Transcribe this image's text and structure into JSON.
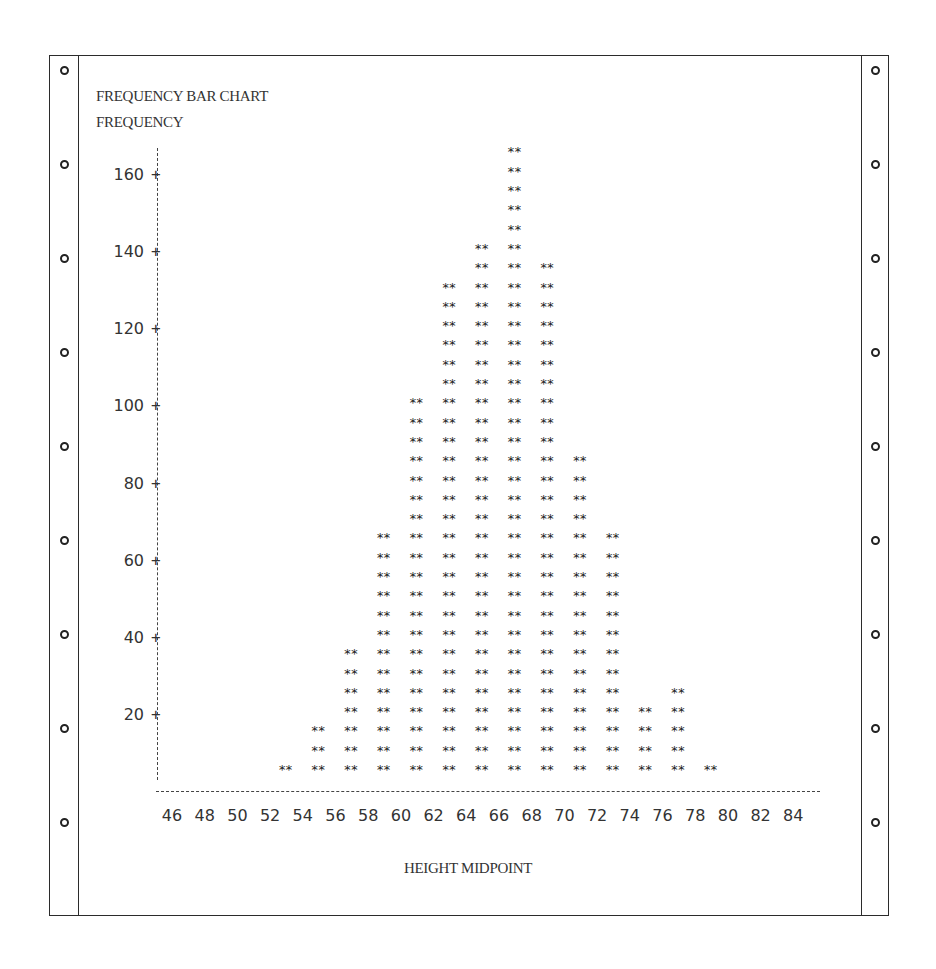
{
  "header": {
    "title": "FREQUENCY BAR CHART",
    "ylabel": "FREQUENCY"
  },
  "xaxis": {
    "label": "HEIGHT MIDPOINT",
    "ticks": [
      "46",
      "48",
      "50",
      "52",
      "54",
      "56",
      "58",
      "60",
      "62",
      "64",
      "66",
      "68",
      "70",
      "72",
      "74",
      "76",
      "78",
      "80",
      "82",
      "84"
    ]
  },
  "yaxis": {
    "ticks": [
      "160",
      "140",
      "120",
      "100",
      "80",
      "60",
      "40",
      "20"
    ]
  },
  "marker": "**",
  "chart_data": {
    "type": "bar",
    "title": "FREQUENCY BAR CHART",
    "xlabel": "HEIGHT MIDPOINT",
    "ylabel": "FREQUENCY",
    "categories": [
      53,
      55,
      57,
      59,
      61,
      63,
      65,
      67,
      69,
      71,
      73,
      75,
      77,
      79
    ],
    "values": [
      5,
      15,
      35,
      65,
      100,
      130,
      140,
      165,
      135,
      85,
      65,
      20,
      25,
      5
    ],
    "bar_unit": 5,
    "x_tick_labels": [
      46,
      48,
      50,
      52,
      54,
      56,
      58,
      60,
      62,
      64,
      66,
      68,
      70,
      72,
      74,
      76,
      78,
      80,
      82,
      84
    ],
    "y_tick_labels": [
      20,
      40,
      60,
      80,
      100,
      120,
      140,
      160
    ],
    "xlim": [
      46,
      84
    ],
    "ylim": [
      0,
      165
    ],
    "grid": false,
    "legend": null,
    "style": "line-printer asterisk bars on continuous-feed paper"
  },
  "paper": {
    "holes_per_side": 9
  }
}
